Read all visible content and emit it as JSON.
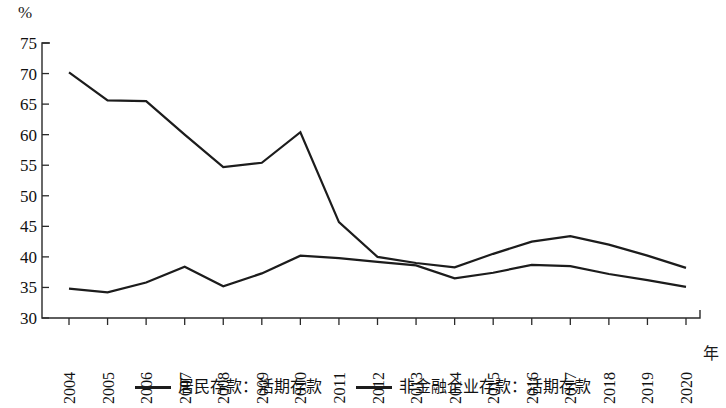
{
  "chart_data": {
    "type": "line",
    "title": "",
    "unit_label": "%",
    "xlabel": "年",
    "ylabel": "%",
    "ylim": [
      30,
      75
    ],
    "ytick_labels": [
      "30",
      "35",
      "40",
      "45",
      "50",
      "55",
      "60",
      "65",
      "70",
      "75"
    ],
    "ytick_values": [
      30,
      35,
      40,
      45,
      50,
      55,
      60,
      65,
      70,
      75
    ],
    "grid": false,
    "legend_position": "bottom",
    "categories": [
      "2004",
      "2005",
      "2006",
      "2007",
      "2008",
      "2009",
      "2010",
      "2011",
      "2012",
      "2013",
      "2014",
      "2015",
      "2016",
      "2017",
      "2018",
      "2019",
      "2020"
    ],
    "series": [
      {
        "name": "居民存款：活期存款",
        "values": [
          34.8,
          34.2,
          35.8,
          38.4,
          35.2,
          37.3,
          40.2,
          39.8,
          39.2,
          38.6,
          36.5,
          37.4,
          38.7,
          38.5,
          37.2,
          36.2,
          35.1
        ]
      },
      {
        "name": "非金融企业存款：活期存款",
        "values": [
          70.2,
          65.6,
          65.5,
          60.0,
          54.7,
          55.4,
          60.4,
          45.7,
          40.0,
          39.0,
          38.3,
          40.5,
          42.5,
          43.4,
          42.0,
          40.2,
          38.2
        ]
      }
    ]
  },
  "legend": {
    "items": [
      {
        "label": "居民存款：活期存款",
        "color": "#1c1c1c"
      },
      {
        "label": "非金融企业存款：活期存款",
        "color": "#1c1c1c"
      }
    ]
  },
  "axis": {
    "x_title": "年",
    "y_unit": "%"
  }
}
